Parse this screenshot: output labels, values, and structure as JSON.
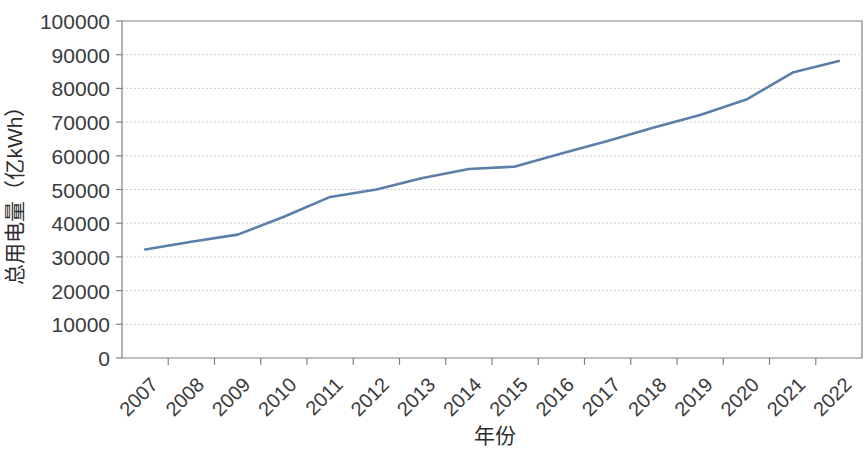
{
  "chart_data": {
    "type": "line",
    "title": "",
    "xlabel": "年份",
    "ylabel": "总用电量（亿kWh）",
    "categories": [
      "2007",
      "2008",
      "2009",
      "2010",
      "2011",
      "2012",
      "2013",
      "2014",
      "2015",
      "2016",
      "2017",
      "2018",
      "2019",
      "2020",
      "2021",
      "2022"
    ],
    "series": [
      {
        "name": "总用电量",
        "color": "#5b7fa8",
        "values": [
          32200,
          34500,
          36600,
          41900,
          47800,
          50000,
          53400,
          56100,
          56800,
          60700,
          64400,
          68400,
          72100,
          76700,
          84700,
          88100
        ]
      }
    ],
    "ylim": [
      0,
      100000
    ],
    "yticks": [
      0,
      10000,
      20000,
      30000,
      40000,
      50000,
      60000,
      70000,
      80000,
      90000,
      100000
    ],
    "ytick_labels": [
      "0",
      "10000",
      "20000",
      "30000",
      "40000",
      "50000",
      "60000",
      "70000",
      "80000",
      "90000",
      "100000"
    ],
    "grid": true,
    "grid_axis": "y",
    "legend": "none",
    "xtick_rotation": 45
  }
}
